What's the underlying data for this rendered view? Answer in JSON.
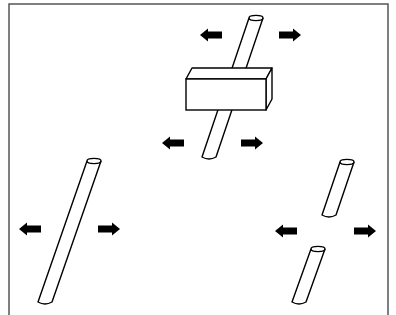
{
  "diagram": {
    "colors": {
      "stroke": "#000000",
      "fill": "#ffffff",
      "frame": "#555555",
      "arrow": "#000000"
    },
    "panels": [
      {
        "id": "rod-through-block",
        "rod": {
          "top": [
            256,
            18
          ],
          "bottom": [
            209,
            157
          ]
        },
        "block": {
          "front_x": 186,
          "front_y": 79,
          "front_w": 80,
          "front_h": 31,
          "depth_dx": 6,
          "depth_dy": -11
        },
        "arrows": [
          {
            "dir": "left",
            "x": 200,
            "y": 35
          },
          {
            "dir": "right",
            "x": 279,
            "y": 35
          },
          {
            "dir": "left",
            "x": 162,
            "y": 143
          },
          {
            "dir": "right",
            "x": 241,
            "y": 143
          }
        ]
      },
      {
        "id": "intact-rod",
        "rod": {
          "top": [
            94,
            161
          ],
          "bottom": [
            45,
            302
          ]
        },
        "arrows": [
          {
            "dir": "left",
            "x": 19,
            "y": 229
          },
          {
            "dir": "right",
            "x": 98,
            "y": 229
          }
        ]
      },
      {
        "id": "broken-rod",
        "rods": [
          {
            "top": [
              347,
              162
            ],
            "bottom": [
              329,
              215
            ]
          },
          {
            "top": [
              318,
              249
            ],
            "bottom": [
              299,
              302
            ]
          }
        ],
        "arrows": [
          {
            "dir": "left",
            "x": 275,
            "y": 231
          },
          {
            "dir": "right",
            "x": 354,
            "y": 231
          }
        ]
      }
    ]
  }
}
